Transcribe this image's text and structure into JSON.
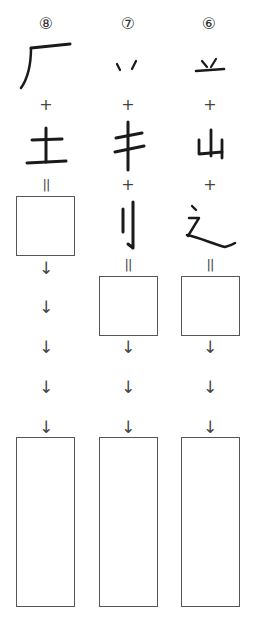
{
  "columns": [
    {
      "id": "col-8",
      "number": "⑧",
      "parts": [
        "厂",
        "土"
      ],
      "operators": [
        "+"
      ],
      "equals": "=",
      "answer_box": "",
      "arrows": [
        "↓",
        "↓",
        "↓",
        "↓",
        "↓"
      ],
      "writing_box": ""
    },
    {
      "id": "col-7",
      "number": "⑦",
      "parts": [
        "丷",
        "丰",
        "刂"
      ],
      "operators": [
        "+",
        "+"
      ],
      "equals": "=",
      "answer_box": "",
      "arrows": [
        "↓",
        "↓",
        "↓"
      ],
      "writing_box": ""
    },
    {
      "id": "col-6",
      "number": "⑥",
      "parts": [
        "䒑",
        "山",
        "辶"
      ],
      "operators": [
        "+",
        "+"
      ],
      "equals": "=",
      "answer_box": "",
      "arrows": [
        "↓",
        "↓",
        "↓"
      ],
      "writing_box": ""
    }
  ]
}
